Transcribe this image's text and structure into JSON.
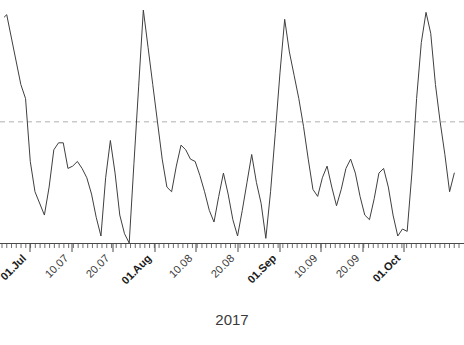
{
  "chart_data": {
    "type": "line",
    "title": "",
    "xlabel": "2017",
    "ylabel": "",
    "grid": false,
    "legend": "none",
    "xlim": [
      0,
      97
    ],
    "ylim": [
      0,
      100
    ],
    "reference_line": {
      "label": "threshold",
      "value": 52,
      "style": "dashed",
      "color": "#b0b0b0"
    },
    "series": [
      {
        "name": "daily value",
        "color": "#3f3f3f",
        "x": [
          0.5,
          1,
          4,
          5,
          6,
          7,
          9,
          10,
          11,
          12,
          13,
          14,
          15,
          16,
          17,
          18,
          19,
          20,
          21,
          22,
          23,
          24,
          25,
          26,
          27,
          28,
          29,
          30,
          31,
          32,
          33,
          34,
          35,
          36,
          37,
          38,
          39,
          40,
          41,
          42,
          43,
          44,
          45,
          46,
          47,
          48,
          49,
          50,
          51,
          52,
          53,
          54,
          55,
          56,
          57,
          58,
          59,
          60,
          61,
          62,
          63,
          64,
          65,
          66,
          67,
          68,
          69,
          70,
          71,
          72,
          73,
          74,
          75,
          76,
          77,
          78,
          79,
          80,
          81,
          82,
          83,
          84,
          85,
          86,
          87,
          88,
          89,
          90,
          91,
          92,
          93,
          94,
          95,
          96
        ],
        "values": [
          97,
          98,
          68,
          62,
          35,
          22,
          12,
          24,
          40,
          43,
          43,
          32,
          33,
          35,
          32,
          28,
          21,
          11,
          3,
          28,
          44,
          30,
          12,
          4,
          0,
          34,
          67,
          100,
          84,
          68,
          52,
          36,
          24,
          22,
          33,
          42,
          40,
          36,
          35,
          29,
          22,
          14,
          9,
          20,
          30,
          21,
          10,
          3,
          14,
          26,
          38,
          26,
          17,
          2,
          22,
          47,
          73,
          96,
          82,
          72,
          62,
          50,
          36,
          23,
          20,
          28,
          33,
          24,
          16,
          23,
          32,
          36,
          30,
          20,
          12,
          10,
          19,
          30,
          32,
          24,
          12,
          3,
          6,
          5,
          30,
          62,
          86,
          99,
          90,
          68,
          52,
          38,
          22,
          30
        ]
      }
    ],
    "x_major_ticks": [
      {
        "label": "01.Jul",
        "bold": true,
        "x_px": 30
      },
      {
        "label": "10.07",
        "bold": false,
        "x_px": 72
      },
      {
        "label": "20.07",
        "bold": false,
        "x_px": 113
      },
      {
        "label": "01.Aug",
        "bold": true,
        "x_px": 155
      },
      {
        "label": "10.08",
        "bold": false,
        "x_px": 196
      },
      {
        "label": "20.08",
        "bold": false,
        "x_px": 238
      },
      {
        "label": "01.Sep",
        "bold": true,
        "x_px": 280
      },
      {
        "label": "10.09",
        "bold": false,
        "x_px": 321
      },
      {
        "label": "20.09",
        "bold": false,
        "x_px": 363
      },
      {
        "label": "01.Oct",
        "bold": true,
        "x_px": 404
      }
    ],
    "minor_tick_count": 96,
    "axis_color": "#4a4a4a"
  },
  "axis": {
    "x_title": "2017"
  }
}
